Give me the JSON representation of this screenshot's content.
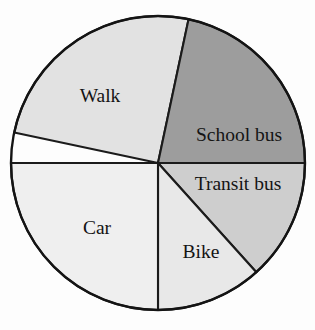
{
  "chart_data": {
    "type": "pie",
    "title": "",
    "xlabel": "",
    "ylabel": "",
    "legend_position": "none",
    "grid": false,
    "labels_inside_slices": true,
    "total_degrees": 360,
    "start_angle_deg": 282,
    "direction": "clockwise",
    "categories": [
      "Walk",
      "School bus",
      "Transit bus",
      "Bike",
      "Car"
    ],
    "values": [
      25,
      21.7,
      13.3,
      11.7,
      25
    ],
    "units": "percent",
    "slices": [
      {
        "label": "Walk",
        "value": 25,
        "start_deg": 282,
        "end_deg": 372,
        "span_deg": 90,
        "color": "#e2e2e2",
        "label_x": 100,
        "label_y": 98
      },
      {
        "label": "School bus",
        "value": 21.7,
        "start_deg": 12,
        "end_deg": 90,
        "span_deg": 78,
        "color": "#9d9d9d",
        "label_x": 239,
        "label_y": 137
      },
      {
        "label": "Transit bus",
        "value": 13.3,
        "start_deg": 90,
        "end_deg": 138,
        "span_deg": 48,
        "color": "#cecece",
        "label_x": 238,
        "label_y": 186
      },
      {
        "label": "Bike",
        "value": 11.7,
        "start_deg": 138,
        "end_deg": 180,
        "span_deg": 42,
        "color": "#e8e8e8",
        "label_x": 201,
        "label_y": 254
      },
      {
        "label": "Car",
        "value": 25,
        "start_deg": 180,
        "end_deg": 270,
        "span_deg": 90,
        "color": "#efefef",
        "label_x": 97,
        "label_y": 230
      }
    ],
    "geometry": {
      "center_x": 158,
      "center_y": 163,
      "radius": 147
    },
    "style": {
      "background": "#fdfdfd",
      "stroke": "#141414",
      "label_color": "#141414"
    }
  }
}
